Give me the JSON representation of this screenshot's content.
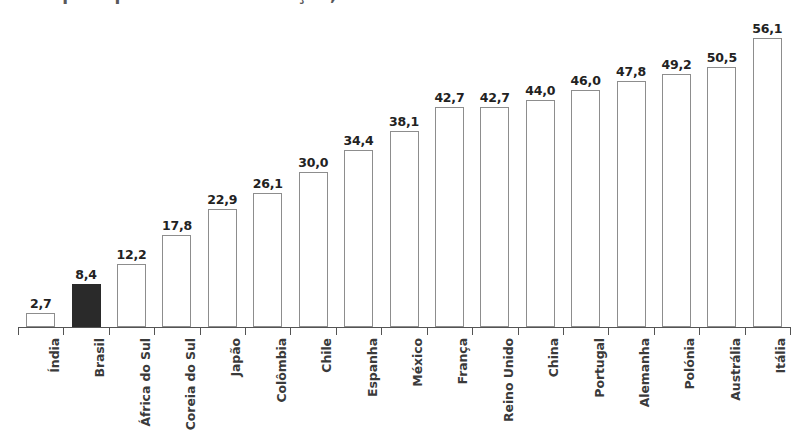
{
  "title": {
    "text": "Despesa pública com educação, 2015",
    "visible_fragment": true,
    "note_clipped": "cropped at top edge of image"
  },
  "chart_data": {
    "type": "bar",
    "title": "Despesa pública com educação, 2015",
    "xlabel": "",
    "ylabel": "",
    "ylim": [
      0,
      56.1
    ],
    "grid": false,
    "legend": "none",
    "decimal_separator": ",",
    "highlight_category": "Brasil",
    "highlight_color": "#2a2a2a",
    "bar_fill_color": "#ffffff",
    "bar_border_color": "#8d8d8d",
    "categories": [
      "Índia",
      "Brasil",
      "África do Sul",
      "Coreia do Sul",
      "Japão",
      "Colômbia",
      "Chile",
      "Espanha",
      "México",
      "França",
      "Reino Unido",
      "China",
      "Portugal",
      "Alemanha",
      "Polónia",
      "Austrália",
      "Itália"
    ],
    "values": [
      2.7,
      8.4,
      12.2,
      17.8,
      22.9,
      26.1,
      30.0,
      34.4,
      38.1,
      42.7,
      42.7,
      44.0,
      46.0,
      47.8,
      49.2,
      50.5,
      56.1
    ],
    "value_labels": [
      "2,7",
      "8,4",
      "12,2",
      "17,8",
      "22,9",
      "26,1",
      "30,0",
      "34,4",
      "38,1",
      "42,7",
      "42,7",
      "44,0",
      "46,0",
      "47,8",
      "49,2",
      "50,5",
      "56,1"
    ]
  }
}
